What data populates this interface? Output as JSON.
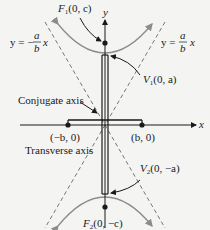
{
  "diagram": {
    "axes": {
      "x_label": "x",
      "y_label": "y"
    },
    "asymptotes": [
      {
        "id": "neg",
        "label_prefix": "y = −",
        "num": "a",
        "den": "b",
        "suffix": "x"
      },
      {
        "id": "pos",
        "label_prefix": "y = ",
        "num": "a",
        "den": "b",
        "suffix": "x"
      }
    ],
    "points": {
      "F1": {
        "label_main": "F",
        "sub": "1",
        "coords": "(0, c)"
      },
      "V1": {
        "label_main": "V",
        "sub": "1",
        "coords": "(0, a)"
      },
      "V2": {
        "label_main": "V",
        "sub": "2",
        "coords": "(0, −a)"
      },
      "F2": {
        "label_main": "F",
        "sub": "2",
        "coords": "(0, −c)"
      },
      "neg_b": {
        "label": "(−b, 0)"
      },
      "pos_b": {
        "label": "(b, 0)"
      }
    },
    "axis_labels": {
      "conjugate": "Conjugate axis",
      "transverse": "Transverse axis"
    },
    "colors": {
      "background": "#f4f4f2",
      "curve": "#8c8c8c",
      "line": "#1a1a1a",
      "asymptote": "#555555"
    }
  }
}
